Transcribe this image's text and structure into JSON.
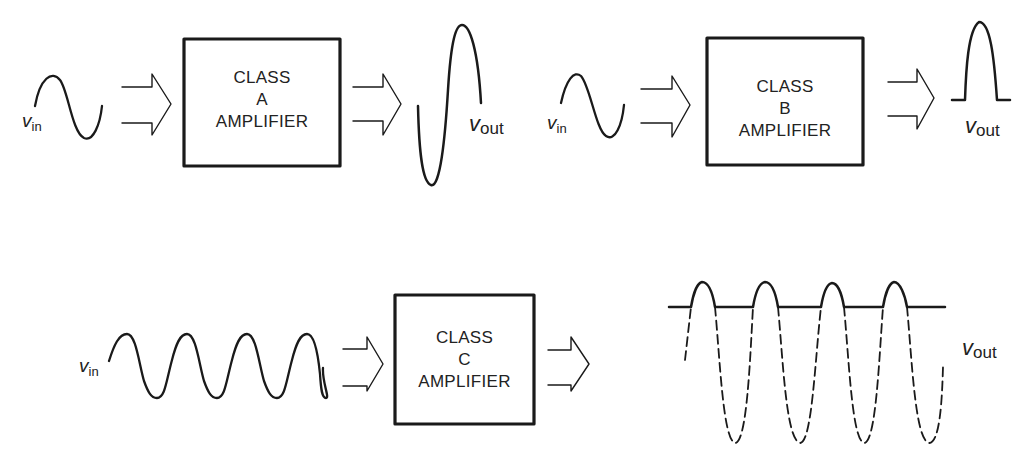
{
  "diagram": {
    "stroke_color": "#1a1a1a",
    "panels": [
      {
        "id": "class-a",
        "box": {
          "line1": "CLASS",
          "line2": "A",
          "line3": "AMPLIFIER"
        },
        "input_label": {
          "symbol": "v",
          "subscript": "in"
        },
        "output_label": {
          "symbol": "v",
          "subscript": "out"
        },
        "input_waveform": "sine, 1 cycle",
        "output_waveform": "amplified sine, full 360° conduction"
      },
      {
        "id": "class-b",
        "box": {
          "line1": "CLASS",
          "line2": "B",
          "line3": "AMPLIFIER"
        },
        "input_label": {
          "symbol": "v",
          "subscript": "in"
        },
        "output_label": {
          "symbol": "v",
          "subscript": "out"
        },
        "input_waveform": "sine, 1 cycle",
        "output_waveform": "half-wave pulse, 180° conduction"
      },
      {
        "id": "class-c",
        "box": {
          "line1": "CLASS",
          "line2": "C",
          "line3": "AMPLIFIER"
        },
        "input_label": {
          "symbol": "v",
          "subscript": "in"
        },
        "output_label": {
          "symbol": "v",
          "subscript": "out"
        },
        "input_waveform": "sine, 4 cycles",
        "output_waveform": "narrow pulses (<180° conduction) with dashed remainder of sine"
      }
    ]
  }
}
